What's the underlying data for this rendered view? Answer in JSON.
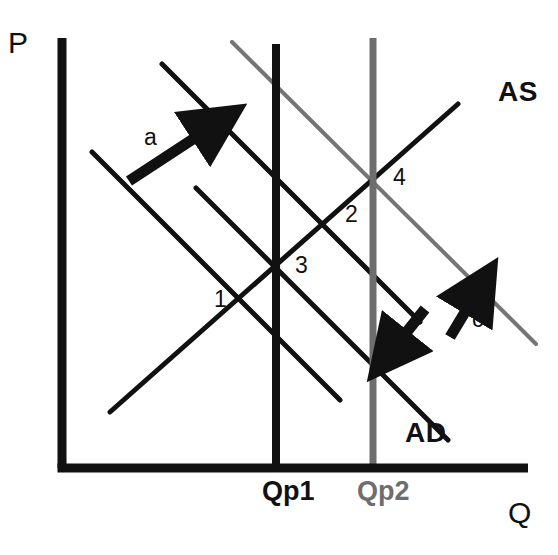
{
  "figure": {
    "kind": "ad-as-diagram",
    "background_color": "#ffffff",
    "ink_color": "#111111",
    "dim_color": "#6e6e6e"
  },
  "axes": {
    "vertical_label": "P",
    "horizontal_label": "Q",
    "vertical_label_pos": {
      "x": 8,
      "y": 28
    },
    "horizontal_label_pos": {
      "x": 508,
      "y": 498
    },
    "origin": {
      "x": 62,
      "y": 468
    },
    "top": {
      "x": 62,
      "y": 38
    },
    "right": {
      "x": 528,
      "y": 468
    },
    "stroke_width": 9
  },
  "curves": [
    {
      "id": "ad-1",
      "name": "AD",
      "role": "aggregate-demand",
      "shade": "dark",
      "stroke_width": 5,
      "x1": 92,
      "y1": 152,
      "x2": 340,
      "y2": 400
    },
    {
      "id": "ad-2",
      "name": "AD",
      "role": "aggregate-demand",
      "shade": "dark",
      "stroke_width": 5,
      "x1": 162,
      "y1": 64,
      "x2": 420,
      "y2": 322
    },
    {
      "id": "ad-3",
      "name": "AD",
      "role": "aggregate-demand",
      "shade": "dark",
      "stroke_width": 5,
      "x1": 196,
      "y1": 188,
      "x2": 448,
      "y2": 440
    },
    {
      "id": "ad-4",
      "name": "AD",
      "role": "aggregate-demand",
      "shade": "light",
      "stroke_width": 4,
      "x1": 232,
      "y1": 42,
      "x2": 536,
      "y2": 344
    },
    {
      "id": "as-1",
      "name": "AS",
      "role": "aggregate-supply",
      "shade": "dark",
      "stroke_width": 5,
      "x1": 110,
      "y1": 412,
      "x2": 458,
      "y2": 104
    }
  ],
  "potential_output_lines": [
    {
      "id": "qp1-line",
      "label": "Qp1",
      "shade": "dark",
      "stroke_width": 8,
      "x": 276,
      "y_top": 44,
      "y_bottom": 468,
      "label_pos": {
        "x": 262,
        "y": 478
      }
    },
    {
      "id": "qp2-line",
      "label": "Qp2",
      "shade": "light",
      "stroke_width": 7,
      "x": 373,
      "y_top": 38,
      "y_bottom": 468,
      "label_pos": {
        "x": 357,
        "y": 478
      }
    }
  ],
  "curve_labels": [
    {
      "id": "as-label",
      "text": "AS",
      "x": 498,
      "y": 78
    },
    {
      "id": "ad-label",
      "text": "AD",
      "x": 405,
      "y": 419
    }
  ],
  "equilibrium_points": [
    {
      "label": "1",
      "x": 214,
      "y": 288
    },
    {
      "label": "2",
      "x": 345,
      "y": 203
    },
    {
      "label": "3",
      "x": 295,
      "y": 254
    },
    {
      "label": "4",
      "x": 393,
      "y": 166
    }
  ],
  "annotations": [
    {
      "id": "arrow-a",
      "label": "a",
      "meaning": "AD shifts right",
      "label_pos": {
        "x": 144,
        "y": 126
      },
      "tail": {
        "x": 129,
        "y": 181
      },
      "head": {
        "x": 216,
        "y": 124
      }
    },
    {
      "id": "arrow-b",
      "label": "b",
      "meaning": "AD shifts left",
      "label_pos": {
        "x": 408,
        "y": 339
      },
      "tail": {
        "x": 425,
        "y": 309
      },
      "head": {
        "x": 390,
        "y": 353
      }
    },
    {
      "id": "arrow-c",
      "label": "c",
      "meaning": "AD shifts right",
      "label_pos": {
        "x": 472,
        "y": 308
      },
      "tail": {
        "x": 450,
        "y": 337
      },
      "head": {
        "x": 479,
        "y": 289
      }
    }
  ]
}
